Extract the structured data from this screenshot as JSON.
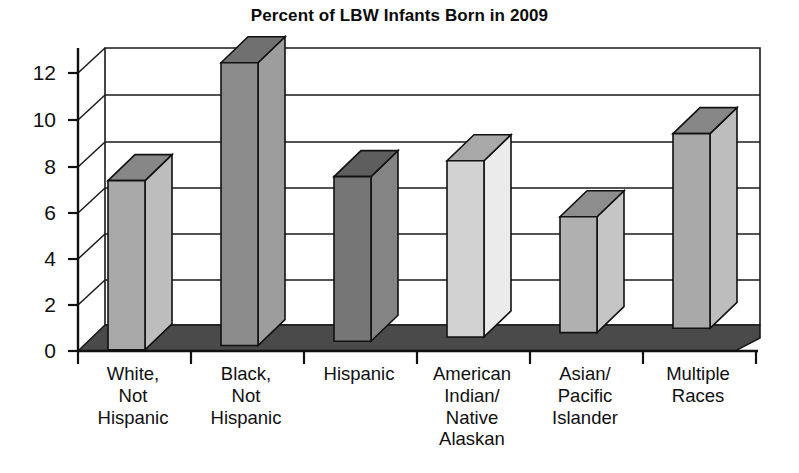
{
  "chart_data": {
    "type": "bar",
    "title": "Percent of LBW Infants Born in 2009",
    "xlabel": "",
    "ylabel": "",
    "ylim": [
      0,
      13
    ],
    "yticks": [
      0,
      2,
      4,
      6,
      8,
      10,
      12
    ],
    "grid": true,
    "legend": "none",
    "style": "3d-bar",
    "categories": [
      "White,\nNot\nHispanic",
      "Black,\nNot\nHispanic",
      "Hispanic",
      "American\nIndian/\nNative\nAlaskan",
      "Asian/\nPacific\nIslander",
      "Multiple\nRaces"
    ],
    "values": [
      7.3,
      12.2,
      7.1,
      7.6,
      5.0,
      8.4
    ],
    "bar_colors": [
      "#a9a9a9",
      "#8c8c8c",
      "#767676",
      "#d2d2d2",
      "#b0b0b0",
      "#a9a9a9"
    ]
  },
  "colors": {
    "floor": "#4a4a4a",
    "axis": "#111111",
    "grid": "#1a1a1a",
    "wall": "#ffffff",
    "text": "#101010"
  },
  "ytick_labels": [
    "0",
    "2",
    "4",
    "6",
    "8",
    "10",
    "12"
  ],
  "xcat_labels": [
    "White,\nNot\nHispanic",
    "Black,\nNot\nHispanic",
    "Hispanic",
    "American\nIndian/\nNative\nAlaskan",
    "Asian/\nPacific\nIslander",
    "Multiple\nRaces"
  ]
}
